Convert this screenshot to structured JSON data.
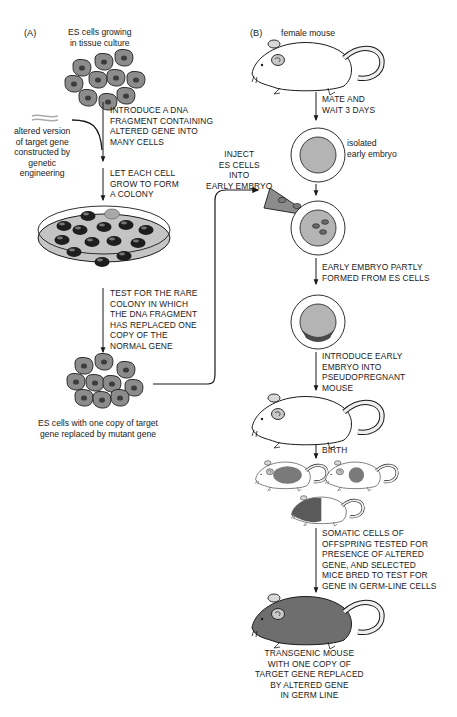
{
  "panel_a": {
    "label": "(A)",
    "start_caption": "ES cells growing\nin tissue culture",
    "step1": "INTRODUCE A DNA\nFRAGMENT CONTAINING\nALTERED GENE INTO\nMANY CELLS",
    "side_caption": "altered version\nof target gene\nconstructed by\ngenetic\nengineering",
    "step2": "LET EACH CELL\nGROW TO FORM\nA COLONY",
    "step3": "TEST FOR THE RARE\nCOLONY IN WHICH\nTHE DNA FRAGMENT\nHAS REPLACED ONE\nCOPY OF THE\nNORMAL GENE",
    "end_caption": "ES cells with one copy of target\ngene replaced by mutant gene"
  },
  "panel_b": {
    "label": "(B)",
    "start_caption": "female mouse",
    "step1": "MATE AND\nWAIT 3 DAYS",
    "embryo_caption": "isolated\nearly embryo",
    "inject": "INJECT\nES CELLS\nINTO\nEARLY EMBRYO",
    "step2": "EARLY EMBRYO PARTLY\nFORMED FROM ES CELLS",
    "step3": "INTRODUCE EARLY\nEMBRYO INTO\nPSEUDOPREGNANT\nMOUSE",
    "step4": "BIRTH",
    "step5": "SOMATIC CELLS OF\nOFFSPRING TESTED FOR\nPRESENCE OF ALTERED\nGENE, AND SELECTED\nMICE BRED TO TEST FOR\nGENE IN GERM-LINE CELLS",
    "end_caption": "TRANSGENIC MOUSE\nWITH ONE COPY OF\nTARGET GENE REPLACED\nBY ALTERED GENE\nIN GERM LINE"
  },
  "colors": {
    "line": "#1a1a1a",
    "cell_fill": "#8c8c8c",
    "cell_nucleus": "#3c3c3c",
    "dish_fill": "#c4c4c4",
    "colony_dark": "#1e1e1e",
    "colony_light": "#a8a8a8",
    "embryo_fill": "#b4b4b4",
    "mouse_dark": "#6e6e6e"
  }
}
